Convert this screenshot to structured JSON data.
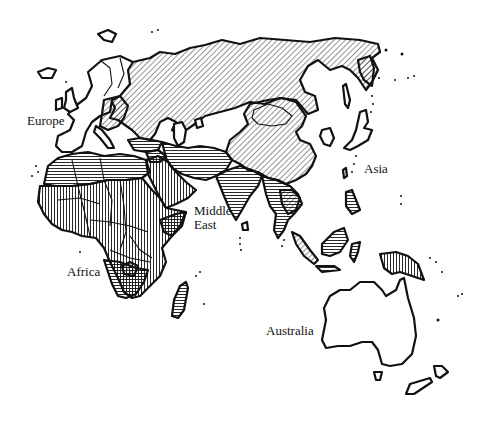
{
  "map": {
    "title": "",
    "regions": [
      {
        "id": "europe",
        "label": "Europe",
        "x": 27,
        "y": 114
      },
      {
        "id": "middle-east",
        "label_line1": "Middle",
        "label_line2": "East",
        "x": 194,
        "y": 204
      },
      {
        "id": "africa",
        "label": "Africa",
        "x": 67,
        "y": 265
      },
      {
        "id": "asia",
        "label": "Asia",
        "x": 364,
        "y": 162
      },
      {
        "id": "australia",
        "label": "Australia",
        "x": 266,
        "y": 324
      }
    ],
    "patterns": {
      "diagonal": "Soviet Union / China / Mongolia / Eastern Europe hatching",
      "horizontal": "Middle East / North Africa / South Asia hatching",
      "vertical": "Sub-Saharan Africa / Arabia hatching",
      "none": "Western Europe, Japan, Australia"
    },
    "colors": {
      "ink": "#111111",
      "background": "#ffffff"
    }
  }
}
